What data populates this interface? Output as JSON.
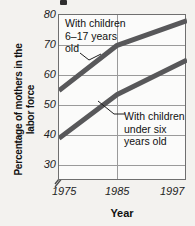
{
  "chart_data": {
    "type": "line",
    "title": "",
    "xlabel": "Year",
    "ylabel": "Percentage of mothers\nin the labor force",
    "x": [
      1975,
      1985,
      1997
    ],
    "xticklabels": [
      "1975",
      "1985",
      "1997"
    ],
    "yticklabels": [
      "30",
      "40",
      "50",
      "60",
      "70",
      "80"
    ],
    "yticks": [
      30,
      40,
      50,
      60,
      70,
      80
    ],
    "ylim": [
      30,
      80
    ],
    "xlim": [
      1975,
      1997
    ],
    "y_axis_break": true,
    "grid": true,
    "legend": "annotations",
    "series": [
      {
        "name": "With children 6–17 years old",
        "values": [
          54.8,
          69.9,
          78.1
        ],
        "color": "#58585a"
      },
      {
        "name": "With children under six years old",
        "values": [
          38.9,
          53.5,
          65.0
        ],
        "color": "#58585a"
      }
    ],
    "annotations": [
      {
        "text": "With children\n6–17 years\nold",
        "series": 0
      },
      {
        "text": "With children\nunder six\nyears old",
        "series": 1
      }
    ]
  },
  "colors": {
    "background": "#f3f2ef",
    "plot_background": "#fbfbfa",
    "gridline": "#9a9a9a",
    "axis": "#6f6f6f",
    "line": "#58585a",
    "text": "#111111"
  }
}
